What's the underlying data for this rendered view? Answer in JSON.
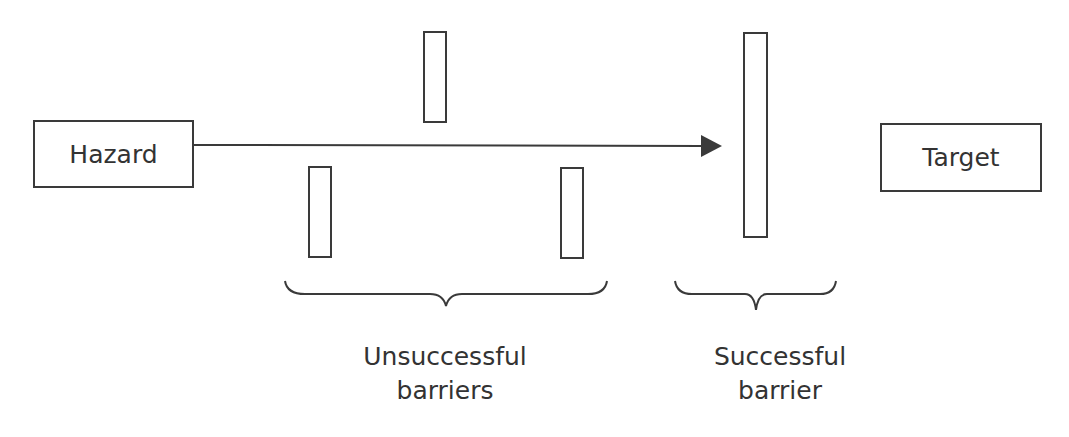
{
  "diagram": {
    "nodes": {
      "hazard": "Hazard",
      "target": "Target"
    },
    "groups": {
      "unsuccessful": {
        "line1": "Unsuccessful",
        "line2": "barriers"
      },
      "successful": {
        "line1": "Successful",
        "line2": "barrier"
      }
    },
    "colors": {
      "stroke": "#3a3a3a",
      "text": "#333333",
      "background": "#ffffff"
    }
  }
}
